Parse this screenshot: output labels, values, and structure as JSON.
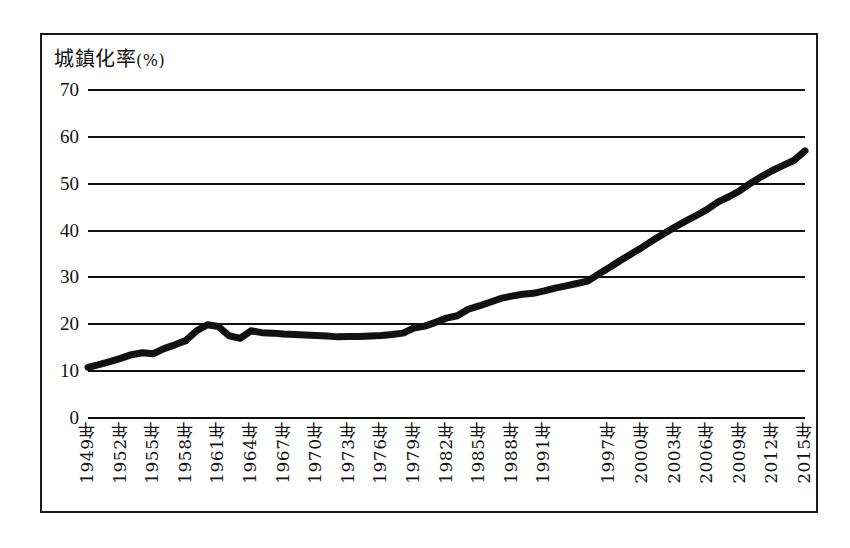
{
  "figure": {
    "title": "城鎮化率",
    "title_unit": "(%)"
  },
  "chart_data": {
    "type": "line",
    "title": "城鎮化率(%)",
    "xlabel": "",
    "ylabel": "城鎮化率(%)",
    "ylim": [
      0,
      70
    ],
    "yticks": [
      0,
      10,
      20,
      30,
      40,
      50,
      60,
      70
    ],
    "grid": true,
    "legend": false,
    "xlim": [
      1949,
      2015
    ],
    "xtick_labels": [
      "1949年",
      "1952年",
      "1955年",
      "1958年",
      "1961年",
      "1964年",
      "1967年",
      "1970年",
      "1973年",
      "1976年",
      "1979年",
      "1982年",
      "1985年",
      "1988年",
      "1991年",
      "1997年",
      "2000年",
      "2003年",
      "2006年",
      "2009年",
      "2012年",
      "2015年"
    ],
    "xtick_years": [
      1949,
      1952,
      1955,
      1958,
      1961,
      1964,
      1967,
      1970,
      1973,
      1976,
      1979,
      1982,
      1985,
      1988,
      1991,
      1994,
      1997,
      2000,
      2003,
      2006,
      2009,
      2012,
      2015
    ],
    "series": [
      {
        "name": "城鎮化率",
        "x": [
          1949,
          1950,
          1951,
          1952,
          1953,
          1954,
          1955,
          1956,
          1957,
          1958,
          1959,
          1960,
          1961,
          1962,
          1963,
          1964,
          1965,
          1966,
          1967,
          1968,
          1969,
          1970,
          1971,
          1972,
          1973,
          1974,
          1975,
          1976,
          1977,
          1978,
          1979,
          1980,
          1981,
          1982,
          1983,
          1984,
          1985,
          1986,
          1987,
          1988,
          1989,
          1990,
          1991,
          1992,
          1993,
          1994,
          1995,
          1996,
          1997,
          1998,
          1999,
          2000,
          2001,
          2002,
          2003,
          2004,
          2005,
          2006,
          2007,
          2008,
          2009,
          2010,
          2011,
          2012,
          2013,
          2014,
          2015
        ],
        "values": [
          10.6,
          11.2,
          11.8,
          12.5,
          13.3,
          13.7,
          13.5,
          14.6,
          15.4,
          16.3,
          18.4,
          19.7,
          19.3,
          17.3,
          16.8,
          18.4,
          18.0,
          17.9,
          17.7,
          17.6,
          17.5,
          17.4,
          17.3,
          17.1,
          17.2,
          17.2,
          17.3,
          17.4,
          17.6,
          17.9,
          19.0,
          19.4,
          20.2,
          21.1,
          21.6,
          23.0,
          23.7,
          24.5,
          25.3,
          25.8,
          26.2,
          26.4,
          26.9,
          27.5,
          28.0,
          28.5,
          29.0,
          30.5,
          31.9,
          33.4,
          34.8,
          36.2,
          37.7,
          39.1,
          40.5,
          41.8,
          43.0,
          44.3,
          45.9,
          47.0,
          48.3,
          49.9,
          51.3,
          52.6,
          53.7,
          54.8,
          56.8
        ]
      }
    ],
    "annotations": [
      {
        "label": "break-at-2000",
        "description": "階梯式跳升",
        "x": 2000,
        "y_from": 30.5,
        "y_to": 36.2
      }
    ],
    "style": {
      "line_color": "#111111",
      "line_width": 7,
      "grid_color": "#111111",
      "background": "#ffffff",
      "frame_color": "#1a1a1a"
    }
  }
}
